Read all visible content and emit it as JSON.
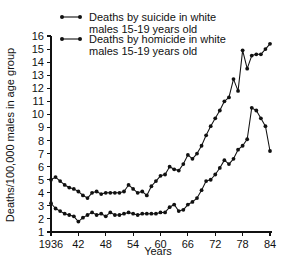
{
  "chart_data": {
    "type": "line",
    "title": "",
    "xlabel": "Years",
    "ylabel": "Deaths/100,000 males in age group",
    "xlim": [
      1936,
      1985
    ],
    "ylim": [
      1,
      16
    ],
    "grid": false,
    "legend_position": "top",
    "xticks": [
      1936,
      1942,
      1948,
      1954,
      1960,
      1966,
      1972,
      1978,
      1984
    ],
    "xticklabels": [
      "1936",
      "42",
      "48",
      "54",
      "60",
      "66",
      "72",
      "78",
      "84"
    ],
    "yticks": [
      1,
      2,
      3,
      4,
      5,
      6,
      7,
      8,
      9,
      10,
      11,
      12,
      13,
      14,
      15,
      16
    ],
    "yticklabels": [
      "1",
      "2",
      "3",
      "4",
      "5",
      "6",
      "7",
      "8",
      "9",
      "10",
      "11",
      "12",
      "13",
      "14",
      "15",
      "16"
    ],
    "x": [
      1936,
      1937,
      1938,
      1939,
      1940,
      1941,
      1942,
      1943,
      1944,
      1945,
      1946,
      1947,
      1948,
      1949,
      1950,
      1951,
      1952,
      1953,
      1954,
      1955,
      1956,
      1957,
      1958,
      1959,
      1960,
      1961,
      1962,
      1963,
      1964,
      1965,
      1966,
      1967,
      1968,
      1969,
      1970,
      1971,
      1972,
      1973,
      1974,
      1975,
      1976,
      1977,
      1978,
      1979,
      1980,
      1981,
      1982,
      1983,
      1984
    ],
    "series": [
      {
        "name": "Deaths by suicide in white males 15-19 years old",
        "marker": "filled-circle",
        "values": [
          5.0,
          5.2,
          4.9,
          4.6,
          4.4,
          4.3,
          4.1,
          3.8,
          3.6,
          4.0,
          4.1,
          3.9,
          4.0,
          4.0,
          4.0,
          4.0,
          4.1,
          4.6,
          4.3,
          4.0,
          4.1,
          3.8,
          4.5,
          4.9,
          5.3,
          5.4,
          6.0,
          5.8,
          5.7,
          6.2,
          6.9,
          6.6,
          7.0,
          7.6,
          8.4,
          9.1,
          9.7,
          10.3,
          11.0,
          11.3,
          12.7,
          11.8,
          14.9,
          13.5,
          14.5,
          14.6,
          14.6,
          15.0,
          15.4
        ]
      },
      {
        "name": "Deaths by homicide in white males 15-19 years old",
        "marker": "filled-circle",
        "values": [
          3.2,
          2.8,
          2.6,
          2.4,
          2.3,
          2.2,
          1.8,
          2.1,
          2.3,
          2.5,
          2.3,
          2.4,
          2.2,
          2.5,
          2.3,
          2.3,
          2.4,
          2.5,
          2.4,
          2.3,
          2.4,
          2.4,
          2.4,
          2.4,
          2.5,
          2.5,
          2.9,
          3.1,
          2.6,
          2.7,
          3.1,
          3.3,
          3.6,
          4.2,
          4.9,
          5.0,
          5.4,
          5.9,
          6.5,
          6.2,
          6.6,
          7.3,
          7.6,
          8.1,
          10.5,
          10.3,
          9.7,
          9.1,
          7.2
        ]
      }
    ],
    "legend": [
      {
        "line1": "Deaths by suicide in white",
        "line2": "males 15-19 years old"
      },
      {
        "line1": "Deaths by homicide in white",
        "line2": "males 15-19 years old"
      }
    ],
    "colors": {
      "ink": "#111111",
      "background": "#ffffff"
    }
  }
}
